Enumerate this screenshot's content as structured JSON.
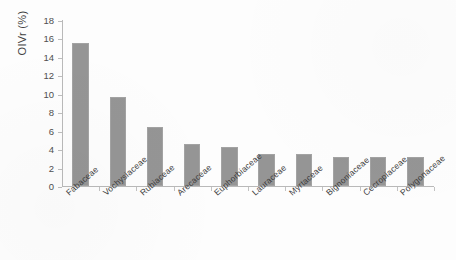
{
  "chart_data": {
    "type": "bar",
    "title": "",
    "xlabel": "",
    "ylabel": "OIVr (%)",
    "ylim": [
      0,
      18
    ],
    "yticks": [
      0,
      2,
      4,
      6,
      8,
      10,
      12,
      14,
      16,
      18
    ],
    "grid": false,
    "legend": null,
    "bar_color": "#8e8e8e",
    "categories": [
      "Fabaceae",
      "Vochysiaceae",
      "Rubiaceae",
      "Arecaceae",
      "Euphorbiaceae",
      "Lauraceae",
      "Myrtaceae",
      "Bignoniaceae",
      "Cecropiaceae",
      "Polygonaceae"
    ],
    "values": [
      15.5,
      9.7,
      6.4,
      4.55,
      4.25,
      3.5,
      3.45,
      3.2,
      3.15,
      3.1
    ]
  },
  "axis": {
    "y_title": "OIVr (%)",
    "tick_labels": [
      "18",
      "16",
      "14",
      "12",
      "10",
      "8",
      "6",
      "4",
      "2",
      "0"
    ]
  }
}
